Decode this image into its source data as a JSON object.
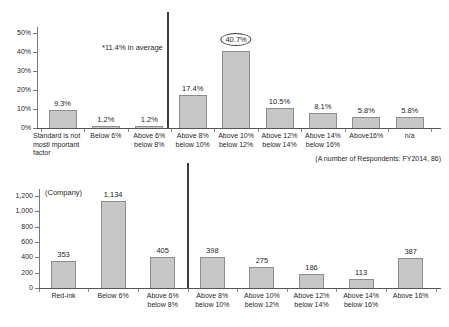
{
  "chart_data": [
    {
      "id": "percent-distribution",
      "type": "bar",
      "title": "",
      "categories": [
        [
          "Standard is not",
          "mostl mportant",
          "factor"
        ],
        [
          "Below 6%"
        ],
        [
          "Above 6%",
          "below 8%"
        ],
        [
          "Above 8%",
          "below 10%"
        ],
        [
          "Above 10%",
          "below 12%"
        ],
        [
          "Above 12%",
          "below 14%"
        ],
        [
          "Above 14%",
          "below 16%"
        ],
        [
          "Above16%"
        ],
        [
          "n/a"
        ]
      ],
      "values": [
        9.3,
        1.2,
        1.2,
        17.4,
        40.7,
        10.5,
        8.1,
        5.8,
        5.8
      ],
      "value_labels": [
        "9.3%",
        "1.2%",
        "1.2%",
        "17.4%",
        "40.7%",
        "10.5%",
        "8.1%",
        "5.8%",
        "5.8%"
      ],
      "highlight_index": 4,
      "highlight_style": "ellipse",
      "y_ticks": [
        "50%",
        "40%",
        "30%",
        "20%",
        "10%",
        "0%"
      ],
      "ylim": [
        0,
        50
      ],
      "grid": false,
      "annotation": "*11.4% in average",
      "footnote": "(A number of Respondents: FY2014, 86)",
      "separator_after_index": 2,
      "bar_fill_color": "#c7c7c7",
      "bar_border_color": "#8d8d8d"
    },
    {
      "id": "company-count",
      "type": "bar",
      "title": "",
      "axis_label": "(Company)",
      "categories": [
        [
          "Red-ink"
        ],
        [
          "Below 6%"
        ],
        [
          "Above 6%",
          "below 8%"
        ],
        [
          "Above 8%",
          "below 10%"
        ],
        [
          "Above 10%",
          "below 12%"
        ],
        [
          "Above 12%",
          "below 14%"
        ],
        [
          "Above 14%",
          "below 16%"
        ],
        [
          "Above 16%"
        ]
      ],
      "values": [
        353,
        1134,
        405,
        398,
        275,
        186,
        113,
        387
      ],
      "value_labels": [
        "353",
        "1,134",
        "405",
        "398",
        "275",
        "186",
        "113",
        "387"
      ],
      "y_ticks": [
        "1,200",
        "1,000",
        "800",
        "600",
        "400",
        "200",
        "0"
      ],
      "ylim": [
        0,
        1200
      ],
      "grid": false,
      "separator_after_index": 2,
      "bar_fill_color": "#c7c7c7",
      "bar_border_color": "#8d8d8d"
    }
  ]
}
